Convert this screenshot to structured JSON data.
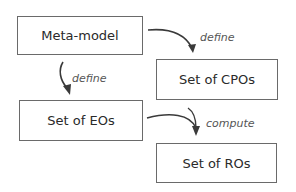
{
  "nodes": {
    "meta_model": "Meta-model",
    "cpos": "Set of CPOs",
    "eos": "Set of EOs",
    "ros": "Set of ROs"
  },
  "edges": {
    "meta_to_cpos": "define",
    "meta_to_eos": "define",
    "eos_to_ros": "compute"
  }
}
